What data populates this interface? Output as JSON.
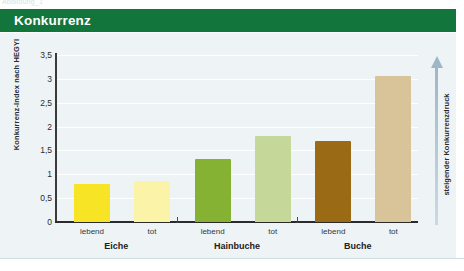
{
  "top_caption": "Abbildung_1",
  "header": {
    "title": "Konkurrenz",
    "band_color": "#12753b"
  },
  "panel": {
    "background_color": "#eef4f6"
  },
  "annotation": {
    "arrow_label": "steigender Konkurrenzdruck",
    "arrow_icon": "up-arrow-icon",
    "arrow_color": "#9fb6c6"
  },
  "chart_data": {
    "type": "bar",
    "title": "Konkurrenz",
    "xlabel": "",
    "ylabel": "Konkurrenz-Index nach HEGYI",
    "ylim": [
      0,
      3.5
    ],
    "ytick_values": [
      0,
      0.5,
      1,
      1.5,
      2,
      2.5,
      3,
      3.5
    ],
    "ytick_labels": [
      "0",
      "0,5",
      "1",
      "1,5",
      "2",
      "2,5",
      "3",
      "3,5"
    ],
    "grid": true,
    "legend": "none",
    "categories": [
      "Eiche",
      "Hainbuche",
      "Buche"
    ],
    "subcategories": [
      "lebend",
      "tot"
    ],
    "series": [
      {
        "name": "lebend",
        "values": [
          0.8,
          1.33,
          1.7
        ]
      },
      {
        "name": "tot",
        "values": [
          0.87,
          1.8,
          3.05
        ]
      }
    ],
    "bars": [
      {
        "group": "Eiche",
        "sub": "lebend",
        "value": 0.8,
        "color": "#f7e424"
      },
      {
        "group": "Eiche",
        "sub": "tot",
        "value": 0.87,
        "color": "#fbf3a8"
      },
      {
        "group": "Hainbuche",
        "sub": "lebend",
        "value": 1.33,
        "color": "#85b233"
      },
      {
        "group": "Hainbuche",
        "sub": "tot",
        "value": 1.8,
        "color": "#c6d79a"
      },
      {
        "group": "Buche",
        "sub": "lebend",
        "value": 1.7,
        "color": "#9a6b14"
      },
      {
        "group": "Buche",
        "sub": "tot",
        "value": 3.05,
        "color": "#d9c49a"
      }
    ]
  }
}
